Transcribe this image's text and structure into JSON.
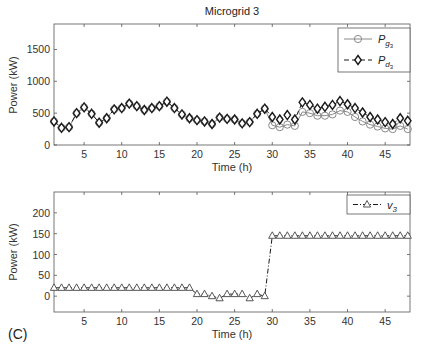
{
  "figure": {
    "title": "Microgrid 3",
    "panel_label": "(C)"
  },
  "chart_data": [
    {
      "type": "line",
      "title": "Microgrid 3",
      "xlabel": "Time (h)",
      "ylabel": "Power (kW)",
      "xlim": [
        1,
        48.3
      ],
      "ylim": [
        0,
        1900
      ],
      "xticks": [
        5,
        10,
        15,
        20,
        25,
        30,
        35,
        40,
        45
      ],
      "yticks": [
        0,
        500,
        1000,
        1500
      ],
      "grid": false,
      "legend_position": "upper right",
      "x": [
        1,
        2,
        3,
        4,
        5,
        6,
        7,
        8,
        9,
        10,
        11,
        12,
        13,
        14,
        15,
        16,
        17,
        18,
        19,
        20,
        21,
        22,
        23,
        24,
        25,
        26,
        27,
        28,
        29,
        30,
        31,
        32,
        33,
        34,
        35,
        36,
        37,
        38,
        39,
        40,
        41,
        42,
        43,
        44,
        45,
        46,
        47,
        48
      ],
      "series": [
        {
          "name": "P_g3",
          "legend_main": "P",
          "legend_sub": "g",
          "legend_subsub": "3",
          "style": "solid",
          "marker": "circle",
          "color": "#8a8a8a",
          "values": [
            370,
            270,
            280,
            500,
            590,
            490,
            350,
            420,
            560,
            580,
            650,
            610,
            550,
            580,
            610,
            680,
            580,
            480,
            420,
            390,
            370,
            330,
            430,
            410,
            400,
            340,
            360,
            490,
            570,
            310,
            280,
            320,
            300,
            520,
            500,
            460,
            460,
            480,
            540,
            520,
            440,
            370,
            320,
            290,
            260,
            250,
            300,
            250
          ]
        },
        {
          "name": "P_d3",
          "legend_main": "P",
          "legend_sub": "d",
          "legend_subsub": "3",
          "style": "dashed",
          "marker": "diamond",
          "color": "#1a1a1a",
          "values": [
            370,
            270,
            280,
            500,
            590,
            490,
            350,
            420,
            560,
            580,
            650,
            610,
            550,
            580,
            610,
            680,
            580,
            480,
            420,
            390,
            370,
            330,
            430,
            410,
            400,
            340,
            360,
            490,
            570,
            440,
            400,
            470,
            400,
            670,
            630,
            570,
            600,
            630,
            690,
            640,
            580,
            510,
            440,
            400,
            360,
            330,
            420,
            380
          ]
        }
      ]
    },
    {
      "type": "line",
      "title": "",
      "xlabel": "Time (h)",
      "ylabel": "Power (kW)",
      "xlim": [
        1,
        48.3
      ],
      "ylim": [
        -38,
        250
      ],
      "xticks": [
        5,
        10,
        15,
        20,
        25,
        30,
        35,
        40,
        45
      ],
      "yticks": [
        0,
        50,
        100,
        150,
        200
      ],
      "grid": false,
      "legend_position": "upper right",
      "x": [
        1,
        2,
        3,
        4,
        5,
        6,
        7,
        8,
        9,
        10,
        11,
        12,
        13,
        14,
        15,
        16,
        17,
        18,
        19,
        20,
        21,
        22,
        23,
        24,
        25,
        26,
        27,
        28,
        29,
        30,
        31,
        32,
        33,
        34,
        35,
        36,
        37,
        38,
        39,
        40,
        41,
        42,
        43,
        44,
        45,
        46,
        47,
        48
      ],
      "series": [
        {
          "name": "v_3",
          "legend_main": "v",
          "legend_sub": "3",
          "style": "dashdot",
          "marker": "triangle",
          "color": "#1a1a1a",
          "values": [
            20,
            20,
            20,
            20,
            20,
            20,
            20,
            20,
            20,
            20,
            20,
            20,
            20,
            20,
            20,
            20,
            20,
            20,
            20,
            5,
            5,
            0,
            -5,
            5,
            5,
            5,
            -5,
            5,
            0,
            145,
            145,
            145,
            145,
            145,
            145,
            145,
            145,
            145,
            145,
            145,
            145,
            145,
            145,
            145,
            145,
            145,
            145,
            145
          ]
        }
      ]
    }
  ]
}
